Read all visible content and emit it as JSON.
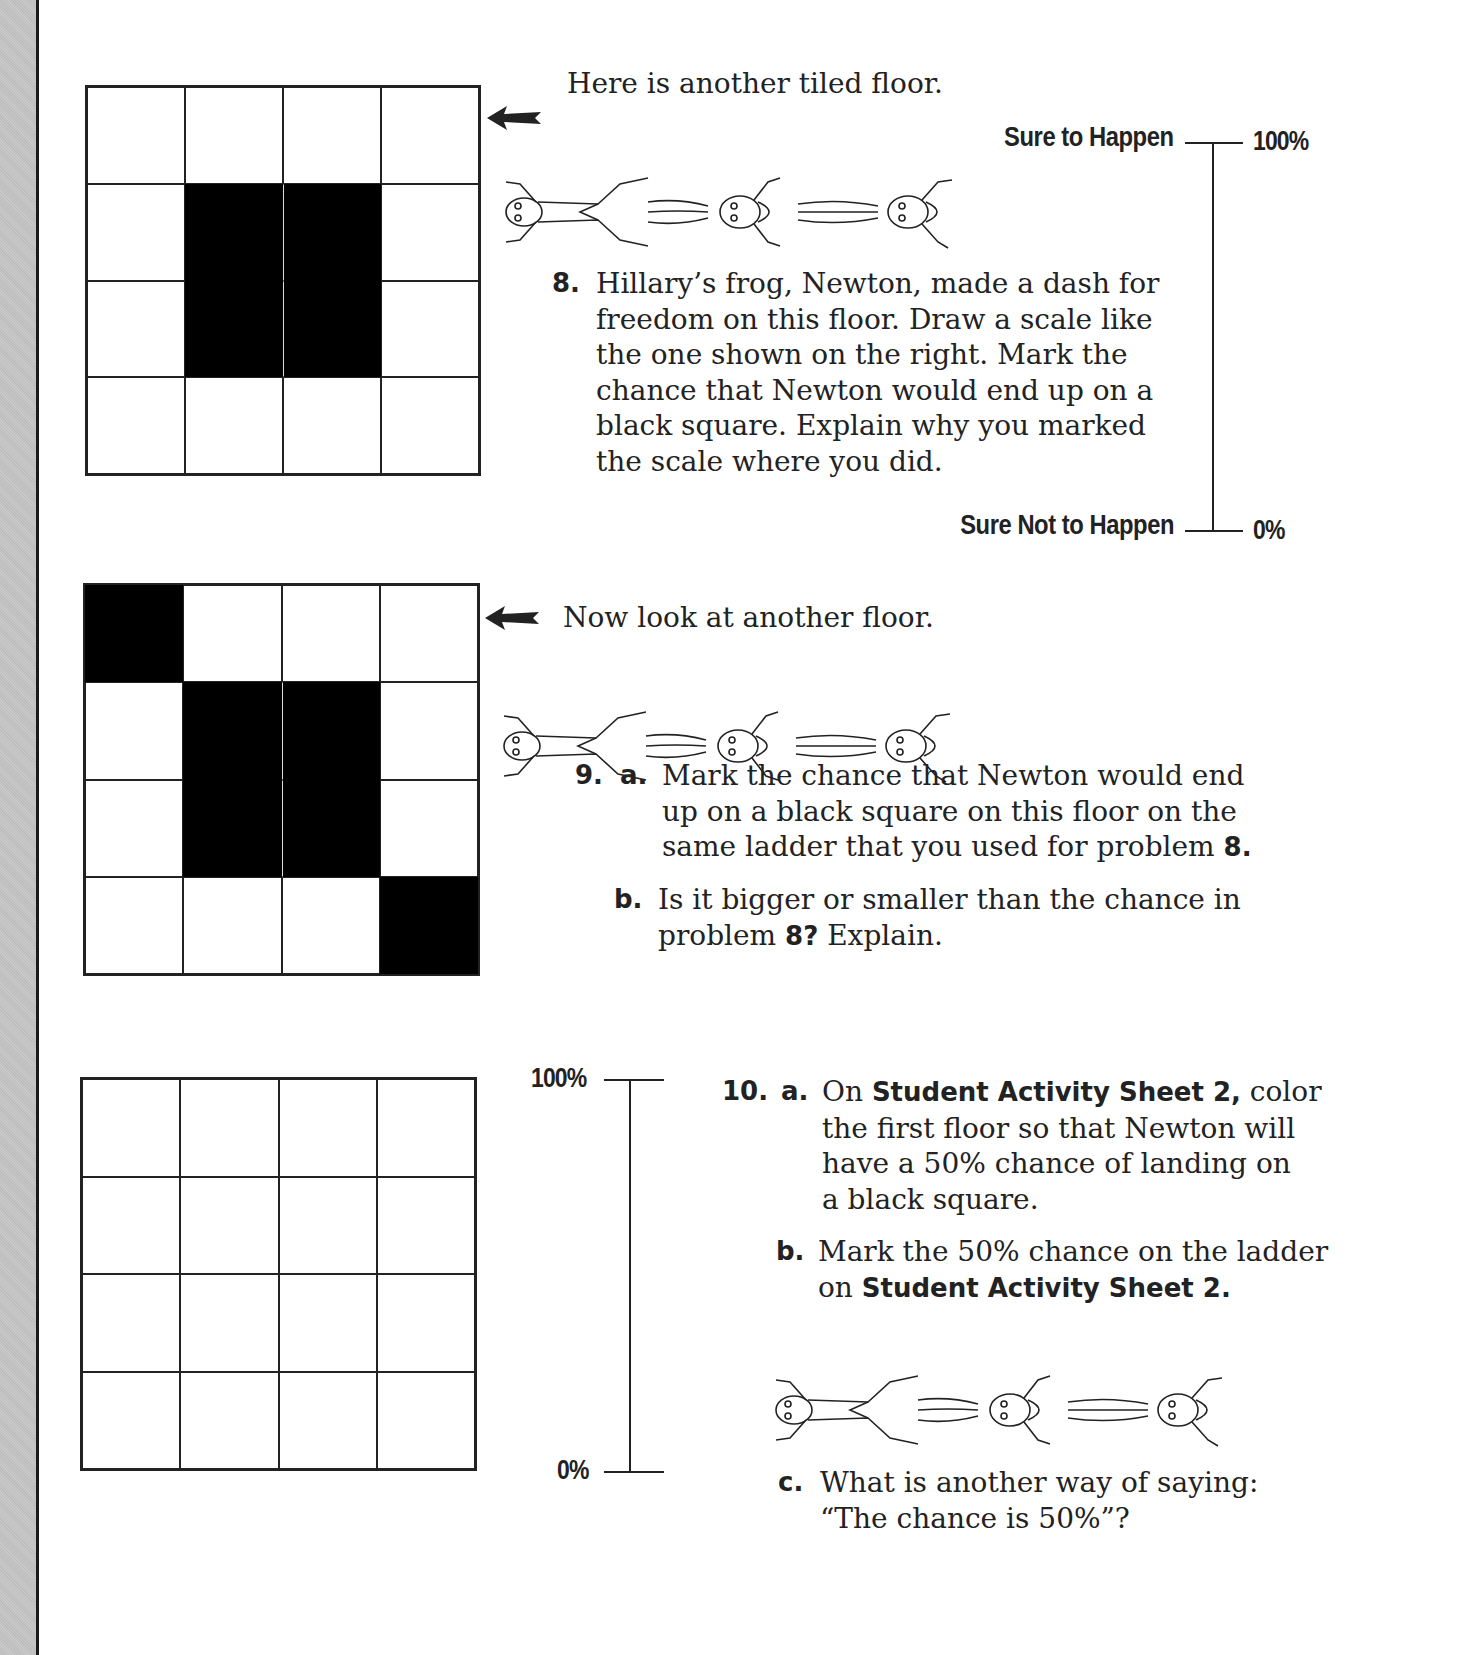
{
  "intro_1": "Here is another tiled floor.",
  "scale_1": {
    "top_label": "Sure to Happen",
    "bottom_label": "Sure Not to Happen",
    "top_pct": "100%",
    "bottom_pct": "0%"
  },
  "problem_8": {
    "number": "8.",
    "lines": [
      "Hillary’s frog, Newton, made a dash for",
      "freedom on this floor. Draw a scale like",
      "the one shown on the right. Mark the",
      "chance that Newton would end up on a",
      "black square. Explain why you marked",
      "the scale where you did."
    ]
  },
  "floor_1": {
    "rows": 4,
    "cols": 4,
    "black_cells": [
      [
        1,
        1
      ],
      [
        1,
        2
      ],
      [
        2,
        1
      ],
      [
        2,
        2
      ]
    ]
  },
  "intro_2": "Now look at another floor.",
  "floor_2": {
    "rows": 4,
    "cols": 4,
    "black_cells": [
      [
        0,
        0
      ],
      [
        1,
        1
      ],
      [
        1,
        2
      ],
      [
        2,
        1
      ],
      [
        2,
        2
      ],
      [
        3,
        3
      ]
    ]
  },
  "problem_9": {
    "number": "9.",
    "a_label": "a.",
    "a_lines": [
      "Mark the chance that Newton would end",
      "up on a black square on this floor on the",
      "same ladder that you used for problem "
    ],
    "a_ref": "8.",
    "b_label": "b.",
    "b_line1": "Is it bigger or smaller than the chance in",
    "b_line2_pre": "problem ",
    "b_line2_ref": "8?",
    "b_line2_post": " Explain."
  },
  "floor_3": {
    "rows": 4,
    "cols": 4,
    "black_cells": []
  },
  "scale_2": {
    "top_pct": "100%",
    "bottom_pct": "0%"
  },
  "problem_10": {
    "number": "10.",
    "a_label": "a.",
    "a_line1_pre": "On ",
    "a_line1_bold": "Student Activity Sheet 2,",
    "a_line1_post": " color",
    "a_lines_rest": [
      "the first floor so that Newton will",
      "have a 50% chance of landing on",
      "a black square."
    ],
    "b_label": "b.",
    "b_line1": "Mark the 50% chance on the ladder",
    "b_line2_pre": "on ",
    "b_line2_bold": "Student Activity Sheet 2.",
    "c_label": "c.",
    "c_line1": "What is another way of saying:",
    "c_line2": "“The chance is 50%”?"
  },
  "icons": {
    "arrow": "left-arrow-icon",
    "frog_sequence": "jumping-frog-illustration"
  },
  "colors": {
    "ink": "#222222",
    "tile_black": "#000000",
    "gutter": "#c4c4c4"
  }
}
